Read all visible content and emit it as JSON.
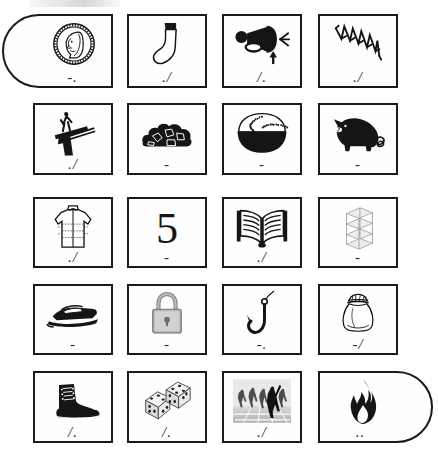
{
  "page": {
    "header_text": "",
    "background_color": "#ffffff",
    "ink_color": "#1a1a1a",
    "columns": 4,
    "rows": 5
  },
  "cards": [
    {
      "id": "card-1",
      "row": 1,
      "col": 1,
      "icon": "coin-icon",
      "label": "coin",
      "mark": "-.",
      "shape": "pill-left"
    },
    {
      "id": "card-2",
      "row": 1,
      "col": 2,
      "icon": "sock-icon",
      "label": "sock",
      "mark": "./",
      "shape": "rect"
    },
    {
      "id": "card-3",
      "row": 1,
      "col": 3,
      "icon": "air-horn-icon",
      "label": "air horn",
      "mark": "/.",
      "shape": "rect"
    },
    {
      "id": "card-4",
      "row": 1,
      "col": 4,
      "icon": "spring-coil-icon",
      "label": "spring",
      "mark": "./",
      "shape": "rect"
    },
    {
      "id": "card-5",
      "row": 2,
      "col": 1,
      "icon": "diving-board-icon",
      "label": "diving board",
      "mark": "./",
      "shape": "rect"
    },
    {
      "id": "card-6",
      "row": 2,
      "col": 2,
      "icon": "coal-pile-icon",
      "label": "coal",
      "mark": "-",
      "shape": "rect"
    },
    {
      "id": "card-7",
      "row": 2,
      "col": 3,
      "icon": "rice-bowl-icon",
      "label": "bowl of rice",
      "mark": "-",
      "shape": "rect"
    },
    {
      "id": "card-8",
      "row": 2,
      "col": 4,
      "icon": "pig-icon",
      "label": "pig",
      "mark": "-",
      "shape": "rect"
    },
    {
      "id": "card-9",
      "row": 3,
      "col": 1,
      "icon": "jacket-icon",
      "label": "jacket",
      "mark": "./",
      "shape": "rect"
    },
    {
      "id": "card-10",
      "row": 3,
      "col": 2,
      "icon": "number-five-icon",
      "label": "5",
      "mark": "-",
      "shape": "rect"
    },
    {
      "id": "card-11",
      "row": 3,
      "col": 3,
      "icon": "open-book-icon",
      "label": "open book",
      "mark": "./",
      "shape": "rect"
    },
    {
      "id": "card-12",
      "row": 3,
      "col": 4,
      "icon": "shelf-rack-icon",
      "label": "shelving unit",
      "mark": "-",
      "shape": "rect"
    },
    {
      "id": "card-13",
      "row": 4,
      "col": 1,
      "icon": "speedboat-icon",
      "label": "speedboat",
      "mark": "-",
      "shape": "rect"
    },
    {
      "id": "card-14",
      "row": 4,
      "col": 2,
      "icon": "padlock-icon",
      "label": "padlock",
      "mark": "-",
      "shape": "rect"
    },
    {
      "id": "card-15",
      "row": 4,
      "col": 3,
      "icon": "fish-hook-icon",
      "label": "fish hook",
      "mark": "-.",
      "shape": "rect"
    },
    {
      "id": "card-16",
      "row": 4,
      "col": 4,
      "icon": "sack-bag-icon",
      "label": "drawstring bag",
      "mark": "-/",
      "shape": "rect"
    },
    {
      "id": "card-17",
      "row": 5,
      "col": 1,
      "icon": "boot-icon",
      "label": "boot",
      "mark": "/.",
      "shape": "rect"
    },
    {
      "id": "card-18",
      "row": 5,
      "col": 2,
      "icon": "dice-icon",
      "label": "dice",
      "mark": "/.",
      "shape": "rect"
    },
    {
      "id": "card-19",
      "row": 5,
      "col": 3,
      "icon": "runners-icon",
      "label": "runners on track",
      "mark": "./",
      "shape": "rect"
    },
    {
      "id": "card-20",
      "row": 5,
      "col": 4,
      "icon": "flame-icon",
      "label": "flame",
      "mark": "..",
      "shape": "pill-right"
    }
  ],
  "geometry": {
    "col_x": [
      33,
      127,
      222,
      318
    ],
    "col_w": [
      80,
      80,
      80,
      80
    ],
    "row_y": [
      14,
      103,
      197,
      284,
      371
    ],
    "row_h": [
      74,
      72,
      71,
      71,
      72
    ],
    "pill_left_x": 2,
    "pill_left_w": 111,
    "pill_right_w": 115
  }
}
